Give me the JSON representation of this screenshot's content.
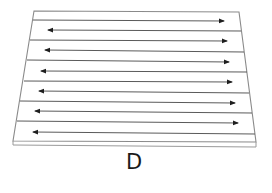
{
  "figure": {
    "label": "D",
    "colors": {
      "line": "#8a8a8a",
      "arrow": "#4a4a4a",
      "arrowhead": "#1e1e1e",
      "label": "#1a1a1a",
      "background": "#ffffff"
    },
    "plate": {
      "top_left": [
        34,
        11
      ],
      "top_right": [
        239,
        12
      ],
      "bottom_left": [
        13,
        142
      ],
      "bottom_right": [
        256,
        144
      ],
      "thickness_px": 4
    },
    "arrows": [
      {
        "y": 20,
        "direction": "right"
      },
      {
        "y": 30,
        "direction": "left"
      },
      {
        "y": 41,
        "direction": "right"
      },
      {
        "y": 51,
        "direction": "left"
      },
      {
        "y": 61,
        "direction": "right"
      },
      {
        "y": 72,
        "direction": "left"
      },
      {
        "y": 82,
        "direction": "right"
      },
      {
        "y": 92,
        "direction": "left"
      },
      {
        "y": 103,
        "direction": "right"
      },
      {
        "y": 112,
        "direction": "left"
      },
      {
        "y": 123,
        "direction": "right"
      },
      {
        "y": 133,
        "direction": "left"
      }
    ],
    "arrow_count": 12
  }
}
